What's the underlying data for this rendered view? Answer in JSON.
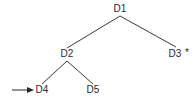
{
  "diagram": {
    "type": "tree",
    "nodes": [
      {
        "id": "D1",
        "label": "D1",
        "marker": ""
      },
      {
        "id": "D2",
        "label": "D2",
        "marker": ""
      },
      {
        "id": "D3",
        "label": "D3",
        "marker": "*"
      },
      {
        "id": "D4",
        "label": "D4",
        "marker": ""
      },
      {
        "id": "D5",
        "label": "D5",
        "marker": ""
      }
    ],
    "edges": [
      {
        "from": "D1",
        "to": "D2"
      },
      {
        "from": "D1",
        "to": "D3"
      },
      {
        "from": "D2",
        "to": "D4"
      },
      {
        "from": "D2",
        "to": "D5"
      }
    ],
    "pointer": {
      "target": "D4",
      "icon": "arrow-right-icon"
    }
  }
}
